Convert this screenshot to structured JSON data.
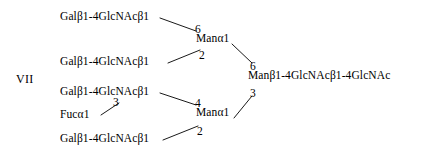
{
  "figure": {
    "label": "VII",
    "background_color": "#ffffff",
    "text_color": "#000000",
    "line_color": "#1a1a1a"
  },
  "nodes": {
    "antenna_1": "Galβ1-4GlcNAcβ1",
    "antenna_2": "Galβ1-4GlcNAcβ1",
    "antenna_3": "Galβ1-4GlcNAcβ1",
    "antenna_4": "Galβ1-4GlcNAcβ1",
    "fucose": "Fucα1",
    "mannose_upper": "Manα1",
    "mannose_lower": "Manα1",
    "core": "Manβ1-4GlcNAcβ1-4GlcNAc"
  },
  "linkages": {
    "antenna1_to_man_upper": "6",
    "antenna2_to_man_upper": "2",
    "man_upper_to_core": "6",
    "antenna3_to_man_lower": "4",
    "fucose_to_antenna3": "3",
    "antenna4_to_man_lower": "2",
    "man_lower_to_core": "3"
  }
}
